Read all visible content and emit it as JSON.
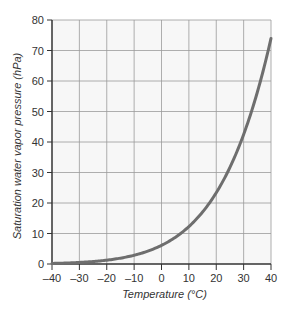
{
  "chart_data": {
    "type": "line",
    "title": "",
    "xlabel": "Temperature (°C)",
    "ylabel": "Saturation water vapor pressure (hPa)",
    "xlim": [
      -40,
      40
    ],
    "ylim": [
      0,
      80
    ],
    "xticks": [
      -40,
      -30,
      -20,
      -10,
      0,
      10,
      20,
      30,
      40
    ],
    "xtick_labels": [
      "–40",
      "–30",
      "–20",
      "–10",
      "0",
      "10",
      "20",
      "30",
      "40"
    ],
    "yticks": [
      0,
      10,
      20,
      30,
      40,
      50,
      60,
      70,
      80
    ],
    "ytick_labels": [
      "0",
      "10",
      "20",
      "30",
      "40",
      "50",
      "60",
      "70",
      "80"
    ],
    "grid": true,
    "legend": null,
    "series": [
      {
        "name": "Saturation water vapor pressure",
        "color": "#6e6e6e",
        "x": [
          -40,
          -35,
          -30,
          -25,
          -20,
          -15,
          -10,
          -5,
          0,
          5,
          10,
          15,
          20,
          25,
          30,
          35,
          40
        ],
        "values": [
          0.2,
          0.3,
          0.5,
          0.8,
          1.3,
          1.9,
          2.9,
          4.2,
          6.1,
          8.7,
          12.3,
          17.0,
          23.4,
          31.7,
          42.4,
          56.2,
          73.8
        ]
      }
    ]
  },
  "colors": {
    "plot_background": "#f7f7f7",
    "grid": "#9a9a9a",
    "axis": "#333333",
    "curve": "#6e6e6e"
  }
}
